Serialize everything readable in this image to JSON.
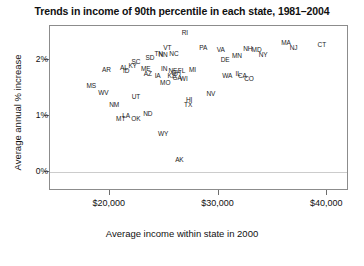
{
  "chart_data": {
    "type": "scatter",
    "title": "Trends in income of 90th percentile in each state, 1981–2004",
    "xlabel": "Average income within state in 2000",
    "ylabel": "Average annual % increase",
    "xlim": [
      14500,
      42000
    ],
    "ylim": [
      -0.35,
      2.62
    ],
    "grid": false,
    "zero_gridline": true,
    "legend": "none",
    "point_style": "text-label (state postal abbreviation)",
    "xticks": [
      {
        "value": 20000,
        "label": "$20,000"
      },
      {
        "value": 30000,
        "label": "$30,000"
      },
      {
        "value": 40000,
        "label": "$40,000"
      }
    ],
    "yticks": [
      {
        "value": 0,
        "label": "0%"
      },
      {
        "value": 1,
        "label": "1%"
      },
      {
        "value": 2,
        "label": "2%"
      }
    ],
    "points": [
      {
        "label": "RI",
        "x": 26900,
        "y": 2.52
      },
      {
        "label": "MA",
        "x": 36200,
        "y": 2.33
      },
      {
        "label": "NJ",
        "x": 36900,
        "y": 2.24
      },
      {
        "label": "CT",
        "x": 39500,
        "y": 2.3
      },
      {
        "label": "PA",
        "x": 28600,
        "y": 2.24
      },
      {
        "label": "VA",
        "x": 30200,
        "y": 2.2
      },
      {
        "label": "NH",
        "x": 32700,
        "y": 2.22
      },
      {
        "label": "MD",
        "x": 33500,
        "y": 2.2
      },
      {
        "label": "NY",
        "x": 34100,
        "y": 2.12
      },
      {
        "label": "MN",
        "x": 31700,
        "y": 2.1
      },
      {
        "label": "DE",
        "x": 30600,
        "y": 2.02
      },
      {
        "label": "VT",
        "x": 25300,
        "y": 2.25
      },
      {
        "label": "NC",
        "x": 25900,
        "y": 2.14
      },
      {
        "label": "TN",
        "x": 24500,
        "y": 2.13
      },
      {
        "label": "NN",
        "x": 24900,
        "y": 2.12
      },
      {
        "label": "SD",
        "x": 23700,
        "y": 2.06
      },
      {
        "label": "SC",
        "x": 22400,
        "y": 1.99
      },
      {
        "label": "KY",
        "x": 22100,
        "y": 1.92
      },
      {
        "label": "AL",
        "x": 21300,
        "y": 1.88
      },
      {
        "label": "ID",
        "x": 21500,
        "y": 1.82
      },
      {
        "label": "ME",
        "x": 23300,
        "y": 1.86
      },
      {
        "label": "IN",
        "x": 25000,
        "y": 1.86
      },
      {
        "label": "MI",
        "x": 27600,
        "y": 1.84
      },
      {
        "label": "AR",
        "x": 19700,
        "y": 1.85
      },
      {
        "label": "AZ",
        "x": 23500,
        "y": 1.78
      },
      {
        "label": "IA",
        "x": 24400,
        "y": 1.73
      },
      {
        "label": "NE",
        "x": 25800,
        "y": 1.82
      },
      {
        "label": "OH",
        "x": 26100,
        "y": 1.8
      },
      {
        "label": "FL",
        "x": 26600,
        "y": 1.83
      },
      {
        "label": "KS",
        "x": 25700,
        "y": 1.73
      },
      {
        "label": "GA",
        "x": 26200,
        "y": 1.7
      },
      {
        "label": "WI",
        "x": 26800,
        "y": 1.68
      },
      {
        "label": "MO",
        "x": 25100,
        "y": 1.62
      },
      {
        "label": "WA",
        "x": 30800,
        "y": 1.74
      },
      {
        "label": "IL",
        "x": 31800,
        "y": 1.78
      },
      {
        "label": "CA",
        "x": 32200,
        "y": 1.73
      },
      {
        "label": "CO",
        "x": 32800,
        "y": 1.68
      },
      {
        "label": "MS",
        "x": 18300,
        "y": 1.55
      },
      {
        "label": "WV",
        "x": 19400,
        "y": 1.44
      },
      {
        "label": "UT",
        "x": 22400,
        "y": 1.36
      },
      {
        "label": "NV",
        "x": 29300,
        "y": 1.42
      },
      {
        "label": "HI",
        "x": 27300,
        "y": 1.3
      },
      {
        "label": "TX",
        "x": 27200,
        "y": 1.22
      },
      {
        "label": "NM",
        "x": 20400,
        "y": 1.21
      },
      {
        "label": "LA",
        "x": 21500,
        "y": 1.02
      },
      {
        "label": "MT",
        "x": 21000,
        "y": 0.96
      },
      {
        "label": "OK",
        "x": 22400,
        "y": 0.96
      },
      {
        "label": "ND",
        "x": 23500,
        "y": 1.06
      },
      {
        "label": "WY",
        "x": 24900,
        "y": 0.7
      },
      {
        "label": "AK",
        "x": 26400,
        "y": 0.22
      }
    ]
  }
}
